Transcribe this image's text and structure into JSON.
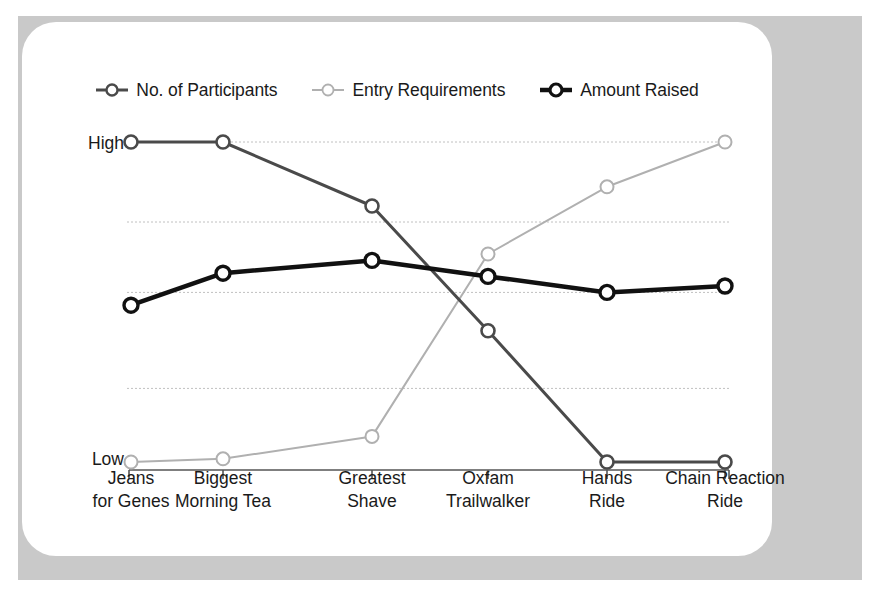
{
  "card": {
    "background_color": "#ffffff",
    "frame_color": "#c9c9c9"
  },
  "legend": {
    "position": "top-center",
    "items": [
      {
        "label": "No. of Participants",
        "color": "#4a4a4a",
        "marker": "circle-open",
        "line_width": 3,
        "icon": "legend-marker-icon"
      },
      {
        "label": "Entry Requirements",
        "color": "#b0b0b0",
        "marker": "circle-open",
        "line_width": 2,
        "icon": "legend-marker-icon"
      },
      {
        "label": "Amount Raised",
        "color": "#111111",
        "marker": "circle-open",
        "line_width": 4.5,
        "icon": "legend-marker-icon"
      }
    ]
  },
  "axes": {
    "y_high_label": "High",
    "y_low_label": "Low",
    "gridline_color": "#c0c0c0",
    "axis_color": "#555555"
  },
  "chart_data": {
    "type": "line",
    "title": "",
    "subtitle": "",
    "xlabel": "",
    "ylabel": "",
    "grid": true,
    "legend_position": "top-center",
    "ylim": [
      0,
      1
    ],
    "ytick_labels": [
      "Low",
      "High"
    ],
    "ytick_values": [
      0,
      1
    ],
    "gridline_values": [
      1.0,
      0.75,
      0.53,
      0.23
    ],
    "categories": [
      "Jeans\nfor Genes",
      "Biggest\nMorning Tea",
      "Greatest\nShave",
      "Oxfam\nTrailwalker",
      "Hands\nRide",
      "Chain Reaction\nRide"
    ],
    "categories_lines": [
      [
        "Jeans",
        "for Genes"
      ],
      [
        "Biggest",
        "Morning Tea"
      ],
      [
        "Greatest",
        "Shave"
      ],
      [
        "Oxfam",
        "Trailwalker"
      ],
      [
        "Hands",
        "Ride"
      ],
      [
        "Chain Reaction",
        "Ride"
      ]
    ],
    "series": [
      {
        "name": "No. of Participants",
        "color": "#4a4a4a",
        "line_width": 3,
        "values": [
          1.0,
          1.0,
          0.8,
          0.41,
          0.0,
          0.0
        ]
      },
      {
        "name": "Entry Requirements",
        "color": "#b0b0b0",
        "line_width": 2,
        "values": [
          0.0,
          0.01,
          0.08,
          0.65,
          0.86,
          1.0
        ]
      },
      {
        "name": "Amount Raised",
        "color": "#111111",
        "line_width": 4.5,
        "values": [
          0.49,
          0.59,
          0.63,
          0.58,
          0.53,
          0.55
        ]
      }
    ]
  }
}
